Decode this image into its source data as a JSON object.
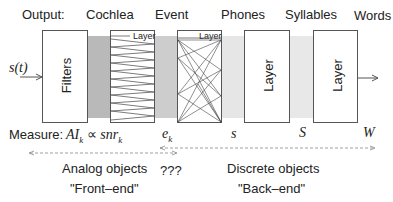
{
  "header": {
    "row_label": "Output:",
    "stages": [
      "Cochlea",
      "Event",
      "Phones",
      "Syllables",
      "Words"
    ]
  },
  "input": {
    "signal": "s(t)"
  },
  "blocks": [
    {
      "id": "filters",
      "label": "Filters"
    },
    {
      "id": "cochlea",
      "label": "Layer"
    },
    {
      "id": "event",
      "label": "Layer"
    },
    {
      "id": "phones",
      "label": "Layer"
    },
    {
      "id": "syllables",
      "label": "Layer"
    }
  ],
  "measure": {
    "row_label": "Measure:",
    "ai": "AI",
    "ai_sub": "k",
    "propto": "∝",
    "snr": "snr",
    "snr_sub": "k",
    "e": "e",
    "e_sub": "k",
    "s": "s",
    "S": "S",
    "W": "W"
  },
  "bottom": {
    "analog": "Analog objects",
    "front_end": "\"Front–end\"",
    "unknown": "???",
    "discrete": "Discrete objects",
    "back_end": "\"Back–end\""
  },
  "colors": {
    "line": "#555555",
    "band_dark": "#b8b8b8",
    "band_mid": "#cfcfcf",
    "band_light": "#e6e6e6",
    "dashed": "#888888"
  }
}
